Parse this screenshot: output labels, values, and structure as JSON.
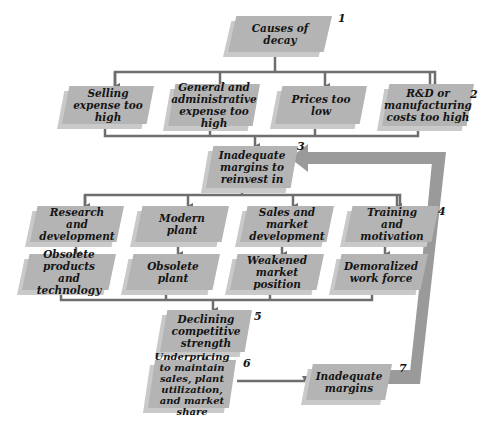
{
  "diagram": {
    "type": "flowchart",
    "colors": {
      "box": "#b4b4b4",
      "box_shadow": "#c9c9c9",
      "connector": "#6e6e6e",
      "feedback_arrow": "#9a9a9a"
    },
    "nodes": {
      "n1": {
        "label": "Causes of decay",
        "number": "1"
      },
      "n2a": {
        "label": "Selling expense too high"
      },
      "n2b": {
        "label": "General and administrative expense too high"
      },
      "n2c": {
        "label": "Prices too low"
      },
      "n2d": {
        "label": "R&D or manufacturing costs too high",
        "number": "2"
      },
      "n3": {
        "label": "Inadequate margins to reinvest in",
        "number": "3"
      },
      "n4a": {
        "label": "Research and development"
      },
      "n4b": {
        "label": "Modern plant"
      },
      "n4c": {
        "label": "Sales and market development"
      },
      "n4d": {
        "label": "Training and motivation",
        "number": "4"
      },
      "n4a2": {
        "label": "Obsolete products and technology"
      },
      "n4b2": {
        "label": "Obsolete plant"
      },
      "n4c2": {
        "label": "Weakened market position"
      },
      "n4d2": {
        "label": "Demoralized work force"
      },
      "n5": {
        "label": "Declining competitive strength",
        "number": "5"
      },
      "n6": {
        "label": "Underpricing to maintain sales, plant utilization, and market share",
        "number": "6"
      },
      "n7": {
        "label": "Inadequate margins",
        "number": "7"
      }
    },
    "edges": [
      [
        "n1",
        "n2a"
      ],
      [
        "n1",
        "n2b"
      ],
      [
        "n1",
        "n2c"
      ],
      [
        "n1",
        "n2d"
      ],
      [
        "n2a",
        "n3"
      ],
      [
        "n2b",
        "n3"
      ],
      [
        "n2c",
        "n3"
      ],
      [
        "n2d",
        "n3"
      ],
      [
        "n3",
        "n4a"
      ],
      [
        "n3",
        "n4b"
      ],
      [
        "n3",
        "n4c"
      ],
      [
        "n3",
        "n4d"
      ],
      [
        "n4a",
        "n4a2"
      ],
      [
        "n4b",
        "n4b2"
      ],
      [
        "n4c",
        "n4c2"
      ],
      [
        "n4d",
        "n4d2"
      ],
      [
        "n4a2",
        "n5"
      ],
      [
        "n4b2",
        "n5"
      ],
      [
        "n4c2",
        "n5"
      ],
      [
        "n4d2",
        "n5"
      ],
      [
        "n5",
        "n6"
      ],
      [
        "n6",
        "n7"
      ],
      [
        "n7",
        "n3"
      ]
    ]
  }
}
